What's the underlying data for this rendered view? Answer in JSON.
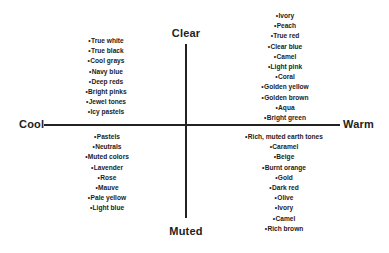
{
  "diagram": {
    "axes": {
      "left_label": "Cool",
      "right_label": "Warm",
      "top_label": "Clear",
      "bottom_label": "Muted",
      "line_color": "#222222"
    },
    "bullet": "•",
    "quadrants": {
      "cool_clear": {
        "name": "Cool / Clear",
        "terms": [
          "True white",
          "True black",
          "Cool grays",
          "Navy blue",
          "Deep reds",
          "Bright pinks",
          "Jewel tones",
          "Icy pastels"
        ]
      },
      "warm_clear": {
        "name": "Warm / Clear",
        "terms": [
          "Ivory",
          "Peach",
          "True red",
          "Clear blue",
          "Camel",
          "Light pink",
          "Coral",
          "Golden yellow",
          "Golden brown",
          "Aqua",
          "Bright green"
        ]
      },
      "cool_muted": {
        "name": "Cool / Muted",
        "terms": [
          "Pastels",
          "Neutrals",
          "Muted colors",
          "Lavender",
          "Rose",
          "Mauve",
          "Pale yellow",
          "Light blue"
        ]
      },
      "warm_muted": {
        "name": "Warm / Muted",
        "terms": [
          "Rich, muted earth tones",
          "Caramel",
          "Beige",
          "Burnt orange",
          "Gold",
          "Dark red",
          "Olive",
          "Ivory",
          "Camel",
          "Rich brown"
        ]
      }
    }
  }
}
